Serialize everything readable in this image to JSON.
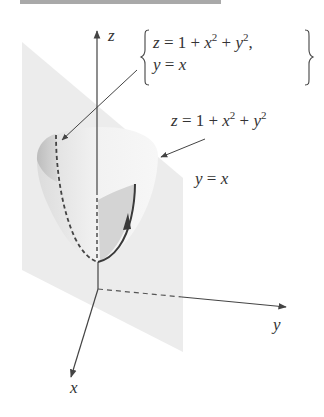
{
  "header_bar": {
    "color": "#a9a9a9"
  },
  "axes": {
    "z_label": "z",
    "y_label": "y",
    "x_label": "x"
  },
  "labels": {
    "system": {
      "line1_lhs": "z",
      "line1_rhs_prefix": " = 1 + ",
      "line1_x": "x",
      "line1_x_exp": "2",
      "line1_plus": " + ",
      "line1_y": "y",
      "line1_y_exp": "2",
      "line1_suffix": ",",
      "line2_lhs": "y",
      "line2_eq": " = ",
      "line2_rhs": "x"
    },
    "paraboloid": {
      "lhs": "z",
      "eq": " = 1 + ",
      "x": "x",
      "x_exp": "2",
      "plus": " + ",
      "y": "y",
      "y_exp": "2"
    },
    "plane": {
      "lhs": "y",
      "eq": " = ",
      "rhs": "x"
    }
  },
  "colors": {
    "plane_fill": "#ececec",
    "paraboloid_fill": "#e6e6e6",
    "paraboloid_inner": "#c8c8c8",
    "axis": "#444444",
    "curve": "#3a3a3a",
    "text": "#333333"
  }
}
